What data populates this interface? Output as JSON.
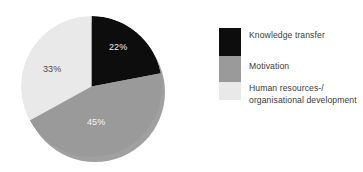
{
  "chart_data": {
    "type": "pie",
    "title": "",
    "subtitle": "",
    "xlabel": "",
    "ylabel": "",
    "grid": false,
    "legend_position": "right",
    "start_angle_deg": 0,
    "direction": "clockwise",
    "three_d_shadow": true,
    "categories": [
      "Knowledge transfer",
      "Motivation",
      "Human resources-/ organisational development"
    ],
    "values": [
      22,
      45,
      33
    ],
    "value_labels": [
      "22%",
      "45%",
      "33%"
    ],
    "colors": [
      "#0d0d0d",
      "#9a9a9a",
      "#e9e9e9"
    ],
    "slices": [
      {
        "name": "Knowledge transfer",
        "value": 22,
        "label": "22%",
        "color": "#0d0d0d",
        "label_color": "#f2f2f2",
        "start_deg": 0,
        "end_deg": 79.2
      },
      {
        "name": "Motivation",
        "value": 45,
        "label": "45%",
        "color": "#9a9a9a",
        "label_color": "#f4f4f4",
        "start_deg": 79.2,
        "end_deg": 241.2
      },
      {
        "name": "Human resources-/ organisational development",
        "value": 33,
        "label": "33%",
        "color": "#e9e9e9",
        "label_color": "#4a4a4a",
        "start_deg": 241.2,
        "end_deg": 360
      }
    ]
  },
  "legend": {
    "items": [
      {
        "label": "Knowledge transfer",
        "label_line_1": "Knowledge transfer",
        "label_line_2": "",
        "color": "#0d0d0d"
      },
      {
        "label": "Motivation",
        "label_line_1": "Motivation",
        "label_line_2": "",
        "color": "#9a9a9a"
      },
      {
        "label": "Human resources-/ organisational development",
        "label_line_1": "Human resources-/",
        "label_line_2": "organisational development",
        "color": "#e9e9e9"
      }
    ]
  },
  "theme": {
    "background": "#ffffff",
    "text_color": "#3b3b3b",
    "shadow_color": "#8f8f8f"
  }
}
